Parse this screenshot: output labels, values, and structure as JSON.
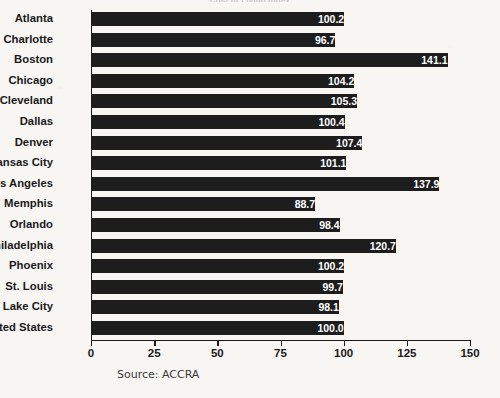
{
  "chart_data": {
    "type": "bar",
    "orientation": "horizontal",
    "title": "Cost of Living Index",
    "title_visible_fragment": "Cost of Living Index",
    "xlabel": "",
    "ylabel": "",
    "xlim": [
      0,
      150
    ],
    "xticks": [
      0,
      25,
      50,
      75,
      100,
      125,
      150
    ],
    "xtick_labels": [
      "0",
      "25",
      "50",
      "75",
      "100",
      "125",
      "150"
    ],
    "grid": false,
    "legend": null,
    "bar_color": "#1d1d1d",
    "value_label_color": "#ffffff",
    "background_color": "#f7f6f3",
    "source_note": "Source: ACCRA",
    "categories": [
      "Atlanta",
      "Charlotte",
      "Boston",
      "Chicago",
      "Cleveland",
      "Dallas",
      "Denver",
      "Kansas City",
      "Los Angeles",
      "Memphis",
      "Orlando",
      "Philadelphia",
      "Phoenix",
      "St. Louis",
      "Salt Lake City",
      "United States"
    ],
    "values": [
      100.2,
      96.7,
      141.1,
      104.2,
      105.3,
      100.4,
      107.4,
      101.1,
      137.9,
      88.7,
      98.4,
      120.7,
      100.2,
      99.7,
      98.1,
      100.0
    ],
    "value_labels": [
      "100.2",
      "96.7",
      "141.1",
      "104.2",
      "105.3",
      "100.4",
      "107.4",
      "101.1",
      "137.9",
      "88.7",
      "98.4",
      "120.7",
      "100.2",
      "99.7",
      "98.1",
      "100.0"
    ]
  }
}
